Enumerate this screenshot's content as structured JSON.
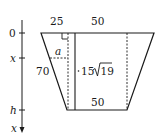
{
  "diagram": {
    "type": "trapezoid-cross-section",
    "axis": {
      "direction": "downward",
      "ticks": [
        {
          "label": "0"
        },
        {
          "label": "x"
        },
        {
          "label": "h"
        }
      ],
      "end_label": "x"
    },
    "dimensions": {
      "top_left_offset": "25",
      "top_segment": "50",
      "slant_side": "70",
      "height": "15√19",
      "height_coef": "15",
      "height_radicand": "19",
      "bottom_base": "50",
      "variable_width": "a"
    },
    "colors": {
      "stroke": "#1a1a1a",
      "background": "#ffffff"
    }
  }
}
